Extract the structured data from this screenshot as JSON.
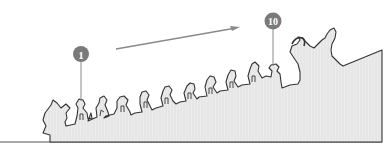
{
  "diagram": {
    "type": "roof-ridge-guardian-figures",
    "markers": [
      {
        "label": "1",
        "cx": 81,
        "cy": 54
      },
      {
        "label": "10",
        "cx": 273,
        "cy": 21
      }
    ],
    "figure_count": 10,
    "arrow_direction": "left-to-right, ascending",
    "colors": {
      "marker_fill": "#7a7a7a",
      "outline": "#3a3a3a",
      "roof_fill": "#e9e9e9",
      "arrow": "#8a8a8a",
      "background": "#ffffff"
    }
  }
}
